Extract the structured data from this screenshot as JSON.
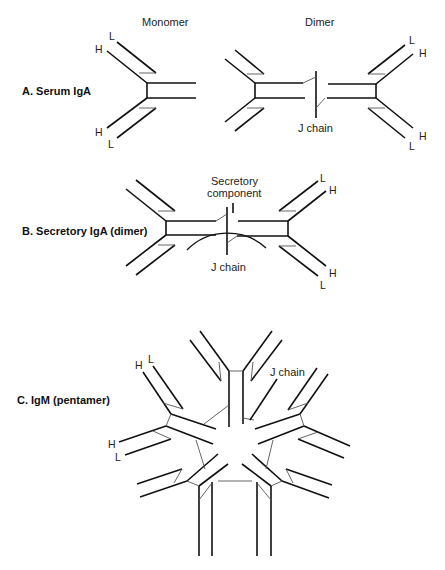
{
  "figure": {
    "column_headers": {
      "monomer": "Monomer",
      "dimer": "Dimer"
    },
    "sections": [
      {
        "id": "A",
        "label": "A. Serum IgA"
      },
      {
        "id": "B",
        "label": "B. Secretory IgA (dimer)"
      },
      {
        "id": "C",
        "label": "C. IgM (pentamer)"
      }
    ],
    "chain_labels": {
      "heavy": "H",
      "light": "L"
    },
    "annotations": {
      "a_j_chain": "J chain",
      "b_secretory_line1": "Secretory",
      "b_secretory_line2": "component",
      "b_j_chain": "J chain",
      "c_j_chain": "J chain"
    },
    "colors": {
      "line": "#111111",
      "disulfide": "#555555",
      "text": "#222222",
      "background": "#ffffff"
    }
  }
}
